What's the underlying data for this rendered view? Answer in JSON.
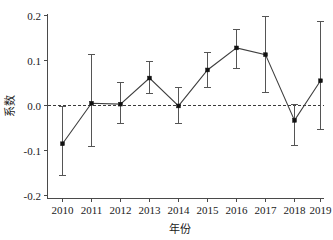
{
  "chart_data": {
    "type": "line",
    "title": "",
    "xlabel": "年份",
    "ylabel": "系数",
    "categories": [
      "2010",
      "2011",
      "2012",
      "2013",
      "2014",
      "2015",
      "2016",
      "2017",
      "2018",
      "2019"
    ],
    "x": [
      2010,
      2011,
      2012,
      2013,
      2014,
      2015,
      2016,
      2017,
      2018,
      2019
    ],
    "values": [
      -0.085,
      0.005,
      0.003,
      0.061,
      -0.001,
      0.079,
      0.128,
      0.113,
      -0.033,
      0.055
    ],
    "error_upper": [
      -0.002,
      0.113,
      0.051,
      0.098,
      0.039,
      0.117,
      0.17,
      0.198,
      0.003,
      0.187
    ],
    "error_lower": [
      -0.156,
      -0.091,
      -0.04,
      0.027,
      -0.041,
      0.039,
      0.083,
      0.03,
      -0.088,
      -0.053
    ],
    "series": [
      {
        "name": "系数",
        "values": [
          -0.085,
          0.005,
          0.003,
          0.061,
          -0.001,
          0.079,
          0.128,
          0.113,
          -0.033,
          0.055
        ]
      }
    ],
    "ylim": [
      -0.2,
      0.2
    ],
    "ytick_values": [
      0.2,
      0.1,
      0.0,
      -0.1,
      -0.2
    ],
    "ytick_labels": [
      "0.2",
      "0.1",
      "0.0",
      "-0.1",
      "-0.2"
    ],
    "xtick_labels": [
      "2010",
      "2011",
      "2012",
      "2013",
      "2014",
      "2015",
      "2016",
      "2017",
      "2018",
      "2019"
    ],
    "grid": false,
    "legend": "none",
    "reference_line": {
      "value": 0,
      "style": "dashed",
      "orientation": "horizontal"
    },
    "marker_style": "filled-square",
    "error_bar_style": "capped-vertical",
    "colors": {
      "line": "#3f3f3f",
      "marker": "#111111",
      "errorbar": "#555555",
      "axis": "#4a4a4a",
      "reference": "#3a3a3a",
      "background": "#ffffff",
      "text": "#1a1a1a"
    }
  }
}
